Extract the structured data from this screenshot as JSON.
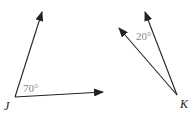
{
  "angles": [
    {
      "vertex_label": "J",
      "measure_label": "70°"
    },
    {
      "vertex_label": "K",
      "measure_label": "20°"
    }
  ],
  "colors": {
    "line": "#222222",
    "measure_text": "#888888"
  }
}
